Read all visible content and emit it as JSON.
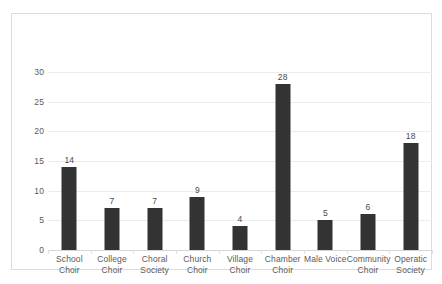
{
  "chart_data": {
    "type": "bar",
    "title": "",
    "subtitle": "",
    "xlabel": "",
    "ylabel": "",
    "categories": [
      "School Choir",
      "College Choir",
      "Choral Society",
      "Church Choir",
      "Village Choir",
      "Chamber Choir",
      "Male Voice",
      "Community Choir",
      "Operatic Society"
    ],
    "category_lines": [
      [
        "School",
        "Choir"
      ],
      [
        "College",
        "Choir"
      ],
      [
        "Choral",
        "Society"
      ],
      [
        "Church",
        "Choir"
      ],
      [
        "Village",
        "Choir"
      ],
      [
        "Chamber",
        "Choir"
      ],
      [
        "Male Voice",
        ""
      ],
      [
        "Community",
        "Choir"
      ],
      [
        "Operatic",
        "Society"
      ]
    ],
    "values": [
      14,
      7,
      7,
      9,
      4,
      28,
      5,
      6,
      18
    ],
    "data_labels": [
      "14",
      "7",
      "7",
      "9",
      "4",
      "28",
      "5",
      "6",
      "18"
    ],
    "ylim": [
      0,
      30
    ],
    "ytick_values": [
      0,
      5,
      10,
      15,
      20,
      25,
      30
    ],
    "ytick_labels": [
      "0",
      "5",
      "10",
      "15",
      "20",
      "25",
      "30"
    ],
    "grid": true,
    "grid_axis": "y",
    "legend": false,
    "legend_position": "none",
    "bar_color": "#333333",
    "gridline_color": "#ececec",
    "axis_label_color": "#5a5a5a",
    "frame_color": "#dcdcdc",
    "background_color": "#ffffff"
  }
}
